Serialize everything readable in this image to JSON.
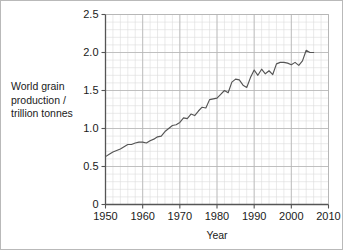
{
  "figure": {
    "background_color": "#ffffff",
    "border_color": "#b9b9b9",
    "line_color": "#555555",
    "major_grid_color": "#b5b5b5",
    "minor_grid_color": "#dcdcdc",
    "axis_color": "#555555"
  },
  "labels": {
    "ylabel_line1": "World grain",
    "ylabel_line2": "production /",
    "ylabel_line3": "trillion tonnes",
    "xlabel": "Year"
  },
  "chart_data": {
    "type": "line",
    "title": "",
    "xlabel": "Year",
    "ylabel": "World grain production / trillion tonnes",
    "xlim": [
      1950,
      2010
    ],
    "ylim": [
      0,
      2.5
    ],
    "xticks": [
      1950,
      1960,
      1970,
      1980,
      1990,
      2000,
      2010
    ],
    "xticklabels": [
      "1950",
      "1960",
      "1970",
      "1980",
      "1990",
      "2000",
      "2010"
    ],
    "yticks": [
      0,
      0.5,
      1.0,
      1.5,
      2.0,
      2.5
    ],
    "yticklabels": [
      "0",
      "0.5",
      "1.0",
      "1.5",
      "2.0",
      "2.5"
    ],
    "minor_xtick_step": 2,
    "minor_ytick_step": 0.1,
    "grid": true,
    "legend": null,
    "series": [
      {
        "name": "World grain production",
        "x": [
          1950,
          1951,
          1952,
          1953,
          1954,
          1955,
          1956,
          1957,
          1958,
          1959,
          1960,
          1961,
          1962,
          1963,
          1964,
          1965,
          1966,
          1967,
          1968,
          1969,
          1970,
          1971,
          1972,
          1973,
          1974,
          1975,
          1976,
          1977,
          1978,
          1979,
          1980,
          1981,
          1982,
          1983,
          1984,
          1985,
          1986,
          1987,
          1988,
          1989,
          1990,
          1991,
          1992,
          1993,
          1994,
          1995,
          1996,
          1997,
          1998,
          1999,
          2000,
          2001,
          2002,
          2003,
          2004,
          2005,
          2006
        ],
        "y": [
          0.63,
          0.66,
          0.69,
          0.71,
          0.73,
          0.76,
          0.79,
          0.79,
          0.81,
          0.82,
          0.82,
          0.81,
          0.84,
          0.86,
          0.89,
          0.9,
          0.96,
          1.0,
          1.04,
          1.05,
          1.08,
          1.14,
          1.13,
          1.19,
          1.17,
          1.23,
          1.28,
          1.27,
          1.38,
          1.39,
          1.4,
          1.45,
          1.5,
          1.47,
          1.61,
          1.65,
          1.64,
          1.57,
          1.54,
          1.67,
          1.77,
          1.7,
          1.78,
          1.72,
          1.76,
          1.71,
          1.85,
          1.87,
          1.87,
          1.86,
          1.84,
          1.87,
          1.83,
          1.89,
          2.03,
          2.0,
          2.0
        ]
      }
    ]
  }
}
